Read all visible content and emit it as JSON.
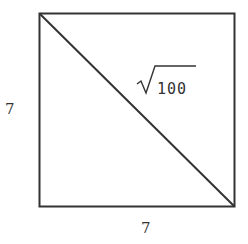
{
  "diagram": {
    "shape": "square",
    "stroke_color": "#333333",
    "side_left_label": "7",
    "side_bottom_label": "7",
    "diagonal_label": {
      "radical": "√",
      "radicand": "100"
    }
  }
}
